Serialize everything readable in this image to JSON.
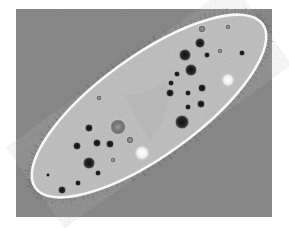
{
  "image": {
    "subject": "paramecium micrograph",
    "alt": "Phase-contrast micrograph of a paramecium with food vacuoles, contractile vacuoles and cilia",
    "colors": {
      "page_bg": "#ffffff",
      "field_bg": "#8c8c8c",
      "cell_fill": "#c4c4c4",
      "membrane": "#f8f8f8",
      "vacuole_dark": "#1e1e1e",
      "vacuole_ring": "#6a6a6a",
      "contractile_vacuole": "#f4f4f4"
    },
    "field": {
      "x": 16,
      "y": 9,
      "w": 256,
      "h": 208
    },
    "body": {
      "cx": 149,
      "cy": 106,
      "rx": 140,
      "ry": 50,
      "angle": -35.8
    },
    "dark_vacuoles": [
      {
        "x": 185,
        "y": 55,
        "r": 6
      },
      {
        "x": 200,
        "y": 43,
        "r": 5
      },
      {
        "x": 207,
        "y": 55,
        "r": 3
      },
      {
        "x": 191,
        "y": 70,
        "r": 6
      },
      {
        "x": 177,
        "y": 74,
        "r": 3
      },
      {
        "x": 171,
        "y": 83,
        "r": 3
      },
      {
        "x": 170,
        "y": 93,
        "r": 4
      },
      {
        "x": 188,
        "y": 93,
        "r": 3
      },
      {
        "x": 202,
        "y": 88,
        "r": 4
      },
      {
        "x": 188,
        "y": 107,
        "r": 3
      },
      {
        "x": 201,
        "y": 104,
        "r": 4
      },
      {
        "x": 182,
        "y": 122,
        "r": 7
      },
      {
        "x": 242,
        "y": 53,
        "r": 3
      },
      {
        "x": 89,
        "y": 128,
        "r": 4
      },
      {
        "x": 97,
        "y": 143,
        "r": 4
      },
      {
        "x": 77,
        "y": 146,
        "r": 4
      },
      {
        "x": 110,
        "y": 144,
        "r": 4
      },
      {
        "x": 89,
        "y": 163,
        "r": 6
      },
      {
        "x": 98,
        "y": 173,
        "r": 3
      },
      {
        "x": 78,
        "y": 183,
        "r": 3
      },
      {
        "x": 62,
        "y": 190,
        "r": 4
      },
      {
        "x": 48,
        "y": 175,
        "r": 2
      }
    ],
    "light_vacuoles": [
      {
        "x": 202,
        "y": 29,
        "r": 4
      },
      {
        "x": 220,
        "y": 51,
        "r": 3
      },
      {
        "x": 228,
        "y": 27,
        "r": 3
      },
      {
        "x": 130,
        "y": 140,
        "r": 4
      },
      {
        "x": 118,
        "y": 127,
        "r": 8
      },
      {
        "x": 113,
        "y": 160,
        "r": 3
      },
      {
        "x": 99,
        "y": 98,
        "r": 3
      }
    ],
    "contractile_vacuoles": [
      {
        "x": 142,
        "y": 153,
        "r": 8
      },
      {
        "x": 228,
        "y": 80,
        "r": 7
      }
    ]
  }
}
